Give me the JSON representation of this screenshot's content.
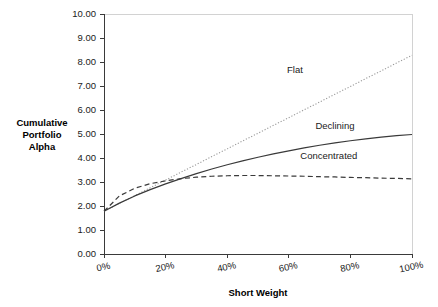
{
  "chart_data": {
    "type": "line",
    "title": "",
    "xlabel": "Short Weight",
    "ylabel": "Cumulative Portfolio Alpha",
    "ylabel_lines": [
      "Cumulative",
      "Portfolio",
      "Alpha"
    ],
    "xlim": [
      0,
      100
    ],
    "ylim": [
      0,
      10
    ],
    "grid": false,
    "legend_position": "inline-labels",
    "x_tick_labels": [
      "0%",
      "20%",
      "40%",
      "60%",
      "80%",
      "100%"
    ],
    "x_ticks": [
      0,
      20,
      40,
      60,
      80,
      100
    ],
    "y_tick_labels": [
      "0.00",
      "1.00",
      "2.00",
      "3.00",
      "4.00",
      "5.00",
      "6.00",
      "7.00",
      "8.00",
      "9.00",
      "10.00"
    ],
    "y_ticks": [
      0,
      1,
      2,
      3,
      4,
      5,
      6,
      7,
      8,
      9,
      10
    ],
    "x": [
      0,
      5,
      10,
      15,
      20,
      25,
      30,
      35,
      40,
      45,
      50,
      55,
      60,
      65,
      70,
      75,
      80,
      85,
      90,
      95,
      100
    ],
    "series": [
      {
        "name": "Flat",
        "dash": "dotted",
        "color": "#9a9a9a",
        "width": 1.1,
        "label_x": 62,
        "label_y": 7.55,
        "values": [
          1.78,
          2.11,
          2.43,
          2.76,
          3.08,
          3.41,
          3.73,
          4.06,
          4.38,
          4.71,
          5.03,
          5.36,
          5.68,
          6.01,
          6.33,
          6.66,
          6.98,
          7.31,
          7.63,
          7.96,
          8.28
        ]
      },
      {
        "name": "Declining",
        "dash": "solid",
        "color": "#3a3a3a",
        "width": 1.2,
        "label_x": 75,
        "label_y": 5.22,
        "values": [
          1.78,
          2.12,
          2.42,
          2.68,
          2.92,
          3.14,
          3.35,
          3.54,
          3.72,
          3.88,
          4.03,
          4.17,
          4.3,
          4.42,
          4.53,
          4.63,
          4.72,
          4.8,
          4.87,
          4.93,
          4.98
        ]
      },
      {
        "name": "Concentrated",
        "dash": "dashed",
        "color": "#3a3a3a",
        "width": 1.2,
        "label_x": 73,
        "label_y": 3.96,
        "values": [
          1.78,
          2.42,
          2.74,
          2.93,
          3.05,
          3.14,
          3.2,
          3.24,
          3.26,
          3.27,
          3.27,
          3.26,
          3.25,
          3.24,
          3.22,
          3.21,
          3.19,
          3.18,
          3.16,
          3.15,
          3.13
        ]
      }
    ]
  },
  "plot_geometry": {
    "left": 104,
    "right": 412,
    "top": 14,
    "bottom": 254
  }
}
